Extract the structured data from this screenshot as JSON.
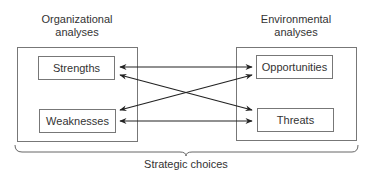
{
  "diagram": {
    "left": {
      "heading_line1": "Organizational",
      "heading_line2": "analyses",
      "items": [
        {
          "label": "Strengths"
        },
        {
          "label": "Weaknesses"
        }
      ]
    },
    "right": {
      "heading_line1": "Environmental",
      "heading_line2": "analyses",
      "items": [
        {
          "label": "Opportunities"
        },
        {
          "label": "Threats"
        }
      ]
    },
    "connections": [
      {
        "from": "Strengths",
        "to": "Opportunities",
        "type": "bidirectional"
      },
      {
        "from": "Strengths",
        "to": "Threats",
        "type": "bidirectional"
      },
      {
        "from": "Weaknesses",
        "to": "Opportunities",
        "type": "bidirectional"
      },
      {
        "from": "Weaknesses",
        "to": "Threats",
        "type": "bidirectional"
      }
    ],
    "footer_label": "Strategic choices",
    "colors": {
      "line": "#222222",
      "box_border": "#777777",
      "text": "#333333"
    }
  }
}
